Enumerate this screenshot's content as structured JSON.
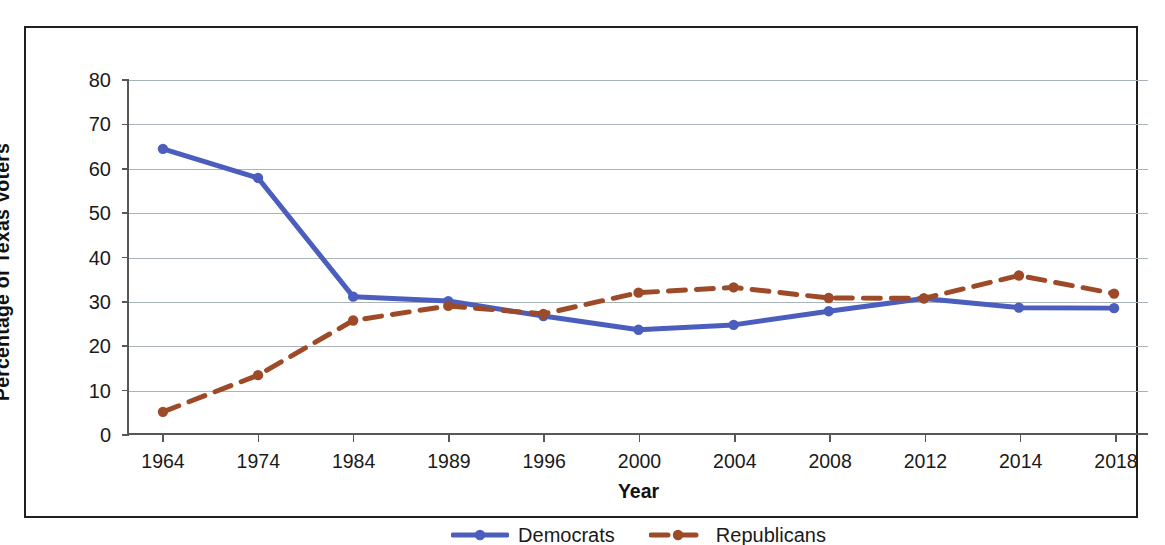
{
  "chart_data": {
    "type": "line",
    "title": "",
    "xlabel": "Year",
    "ylabel": "Percentage of Texas Voters",
    "categories": [
      "1964",
      "1974",
      "1984",
      "1989",
      "1996",
      "2000",
      "2004",
      "2008",
      "2012",
      "2014",
      "2018"
    ],
    "ylim": [
      0,
      80
    ],
    "yticks": [
      0,
      10,
      20,
      30,
      40,
      50,
      60,
      70,
      80
    ],
    "ytick_labels": [
      "0",
      "10",
      "20",
      "30",
      "40",
      "50",
      "60",
      "70",
      "80"
    ],
    "grid": true,
    "legend_position": "bottom-center",
    "series": [
      {
        "name": "Democrats",
        "color": "#4c5ebd",
        "style": "solid",
        "marker": "circle",
        "values": [
          64.4,
          57.8,
          30.9,
          29.9,
          26.5,
          23.4,
          24.5,
          27.6,
          30.5,
          28.4,
          28.3
        ]
      },
      {
        "name": "Republicans",
        "color": "#9d4a28",
        "style": "dashed",
        "marker": "circle",
        "values": [
          4.8,
          13.1,
          25.5,
          28.8,
          27.0,
          31.8,
          33.0,
          30.6,
          30.5,
          35.7,
          31.6
        ]
      }
    ]
  },
  "legend": {
    "items": [
      {
        "label": "Democrats",
        "color": "#4c5ebd",
        "style": "solid"
      },
      {
        "label": "Republicans",
        "color": "#9d4a28",
        "style": "dashed"
      }
    ]
  },
  "axes": {
    "y_title": "Percentage of Texas Voters",
    "x_title": "Year"
  }
}
